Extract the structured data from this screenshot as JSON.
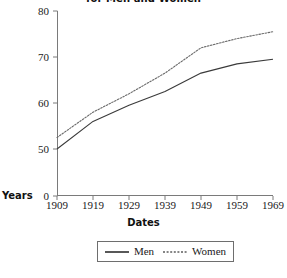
{
  "chart_data": {
    "type": "line",
    "title": "for Men and Women",
    "xlabel": "Dates",
    "ylabel": "Years",
    "x": [
      1909,
      1919,
      1929,
      1939,
      1949,
      1959,
      1969
    ],
    "xtick_labels": [
      "1909",
      "1919",
      "1929",
      "1939",
      "1949",
      "1959",
      "1969"
    ],
    "ytick_labels": [
      "0",
      "50",
      "60",
      "70",
      "80"
    ],
    "ytick_values": [
      0,
      50,
      60,
      70,
      80
    ],
    "ylim": [
      0,
      80
    ],
    "xlim": [
      1909,
      1969
    ],
    "axis_broken": true,
    "grid": false,
    "legend_position": "bottom-center",
    "series": [
      {
        "name": "Men",
        "style": "solid",
        "color": "#3a3a3a",
        "values": [
          50.0,
          56.0,
          59.5,
          62.5,
          66.5,
          68.5,
          69.5
        ]
      },
      {
        "name": "Women",
        "style": "dotted",
        "color": "#6a6a6a",
        "values": [
          52.5,
          58.0,
          62.0,
          66.5,
          72.0,
          74.0,
          75.5
        ]
      }
    ]
  },
  "legend": {
    "men_label": "Men",
    "women_label": "Women"
  },
  "colors": {
    "axis": "#7a7a7a",
    "men": "#3a3a3a",
    "women": "#6a6a6a",
    "text": "#1a1a1a",
    "legend_border": "#6e6e6e"
  }
}
